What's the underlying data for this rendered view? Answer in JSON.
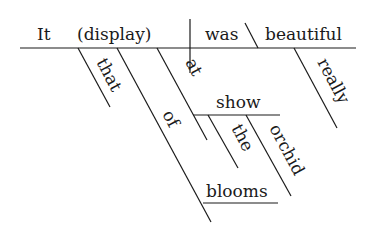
{
  "diagram": {
    "type": "sentence-diagram",
    "subject": "It",
    "appositive": "(display)",
    "verb": "was",
    "complement": "beautiful",
    "modifiers": {
      "that": "that",
      "of": "of",
      "at": "at",
      "show": "show",
      "the": "the",
      "orchid": "orchid",
      "blooms": "blooms",
      "really": "really"
    }
  }
}
